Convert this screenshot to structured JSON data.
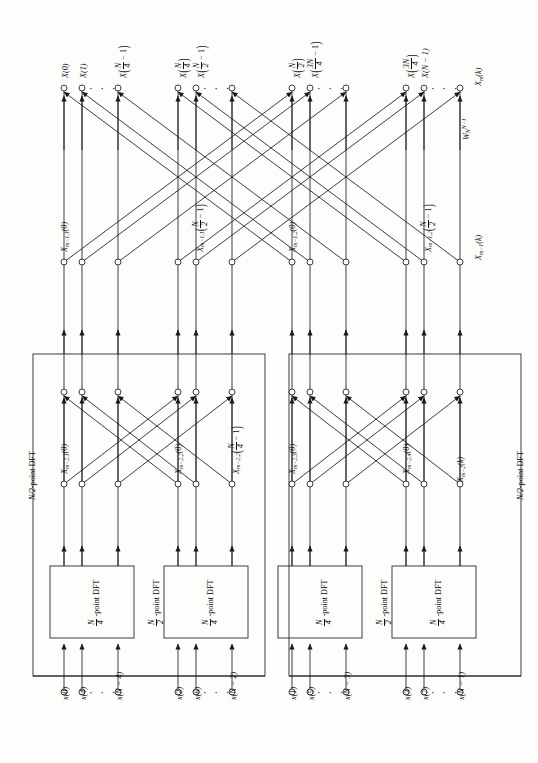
{
  "figure": {
    "orientation": "rotated-90"
  },
  "outputs": {
    "row_label_note": "X_m(k) output stage",
    "stage_label": "X_m(k)",
    "twiddle_label": "W_N^{N-1}",
    "nodes": [
      {
        "id": "o0",
        "x": 64,
        "text_parts": {
          "base": "X",
          "arg": "(0)"
        }
      },
      {
        "id": "o1",
        "x": 82,
        "text_parts": {
          "base": "X",
          "arg": "(1)"
        }
      },
      {
        "id": "o2",
        "x": 118,
        "text_parts": {
          "base": "X",
          "num": "N",
          "den": "4",
          "tail": "− 1"
        }
      },
      {
        "id": "o3",
        "x": 178,
        "text_parts": {
          "base": "X",
          "num": "N",
          "den": "4"
        }
      },
      {
        "id": "o4",
        "x": 196,
        "text_parts": {
          "base": "X",
          "num": "N",
          "den": "2",
          "tail": "− 1"
        }
      },
      {
        "id": "o5",
        "x": 232,
        "text_parts": {
          "base": "X",
          "num": "N",
          "den": "2",
          "hidden": true
        }
      },
      {
        "id": "o6",
        "x": 292,
        "text_parts": {
          "base": "X",
          "num": "N",
          "den": "2"
        }
      },
      {
        "id": "o7",
        "x": 310,
        "text_parts": {
          "base": "X",
          "num": "3N",
          "den": "4",
          "tail": "− 1"
        }
      },
      {
        "id": "o8",
        "x": 346,
        "text_parts": {
          "base": "X"
        }
      },
      {
        "id": "o9",
        "x": 406,
        "text_parts": {
          "base": "X",
          "num": "3N",
          "den": "4"
        }
      },
      {
        "id": "o10",
        "x": 424,
        "text_parts": {
          "base": "X",
          "arg": "(N − 1)"
        }
      },
      {
        "id": "o11",
        "x": 460,
        "text_parts": {
          "base": "X"
        }
      }
    ],
    "labels": [
      "X(0)",
      "X(1)",
      "X(N/4 − 1)",
      "X(N/4)",
      "X(N/2 − 1)",
      "X(N/2)",
      "X(3N/4 − 1)",
      "X(3N/4)",
      "X(N − 1)"
    ]
  },
  "stage_m_minus_1": {
    "labels": [
      {
        "id": "a",
        "text": "X_{m−1,1}(0)"
      },
      {
        "id": "b",
        "text": "X_{m−1,1}(N/2 − 1)"
      },
      {
        "id": "c",
        "text": "X_{m−1,2}(0)"
      },
      {
        "id": "d",
        "text": "X_{m−1,2}(N/2 − 1)"
      },
      {
        "id": "e",
        "text": "X_{m−1}(k)"
      }
    ]
  },
  "stage_m_minus_2": {
    "labels": [
      {
        "id": "a",
        "text": "X_{m−2,1}(0)"
      },
      {
        "id": "b",
        "text": "X_{m−2,2}(0)"
      },
      {
        "id": "c",
        "text": "X_{m−2,2}(N/4 − 1)"
      },
      {
        "id": "d",
        "text": "X_{m−2,3}(0)"
      },
      {
        "id": "e",
        "text": "X_{m−2,4}(0)"
      },
      {
        "id": "f",
        "text": "X_{m−2}(k)"
      }
    ]
  },
  "blocks": {
    "dft_quarter_label": "N/4-point DFT",
    "dft_half_label": "N/2-point DFT",
    "quarter_boxes": [
      {
        "id": "q1",
        "label": "N/4-point DFT"
      },
      {
        "id": "q2",
        "label": "N/4-point DFT"
      },
      {
        "id": "q3",
        "label": "N/4-point DFT"
      },
      {
        "id": "q4",
        "label": "N/4-point DFT"
      }
    ],
    "half_boxes": [
      {
        "id": "h1",
        "label": "N/2-point DFT"
      },
      {
        "id": "h2",
        "label": "N/2-point DFT"
      }
    ],
    "inner_half_labels": [
      {
        "id": "ih1",
        "label": "N/2-point DFT"
      },
      {
        "id": "ih2",
        "label": "N/2-point DFT"
      }
    ]
  },
  "inputs": {
    "groups": [
      {
        "id": "g1",
        "items": [
          "x(0)",
          "x(4)",
          "x(N − 4)"
        ]
      },
      {
        "id": "g2",
        "items": [
          "x(2)",
          "x(6)",
          "x(N − 2)"
        ]
      },
      {
        "id": "g3",
        "items": [
          "x(1)",
          "x(5)",
          "x(N − 3)"
        ]
      },
      {
        "id": "g4",
        "items": [
          "x(3)",
          "x(7)",
          "x(N − 1)"
        ]
      }
    ]
  },
  "colors": {
    "line": "#1a1a1a",
    "text": "#111111",
    "background": "#fdfdfb"
  }
}
